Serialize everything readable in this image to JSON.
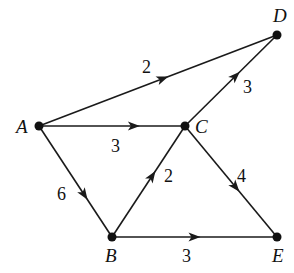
{
  "graph": {
    "type": "directed-weighted-graph",
    "nodes": [
      {
        "id": "A",
        "label": "A",
        "x": 39,
        "y": 126,
        "lx": 16,
        "ly": 133
      },
      {
        "id": "B",
        "label": "B",
        "x": 112,
        "y": 237,
        "lx": 105,
        "ly": 262
      },
      {
        "id": "C",
        "label": "C",
        "x": 185,
        "y": 126,
        "lx": 195,
        "ly": 133
      },
      {
        "id": "D",
        "label": "D",
        "x": 277,
        "y": 35,
        "lx": 273,
        "ly": 22
      },
      {
        "id": "E",
        "label": "E",
        "x": 277,
        "y": 237,
        "lx": 272,
        "ly": 262
      }
    ],
    "edges": [
      {
        "from": "A",
        "to": "D",
        "weight": "2",
        "wx": 142,
        "wy": 73,
        "arrow_t": 0.52
      },
      {
        "from": "A",
        "to": "C",
        "weight": "3",
        "wx": 111,
        "wy": 152,
        "arrow_t": 0.65
      },
      {
        "from": "A",
        "to": "B",
        "weight": "6",
        "wx": 57,
        "wy": 200,
        "arrow_t": 0.62
      },
      {
        "from": "B",
        "to": "C",
        "weight": "2",
        "wx": 164,
        "wy": 182,
        "arrow_t": 0.55
      },
      {
        "from": "C",
        "to": "D",
        "weight": "3",
        "wx": 243,
        "wy": 93,
        "arrow_t": 0.55
      },
      {
        "from": "C",
        "to": "E",
        "weight": "4",
        "wx": 237,
        "wy": 182,
        "arrow_t": 0.55
      },
      {
        "from": "B",
        "to": "E",
        "weight": "3",
        "wx": 182,
        "wy": 262,
        "arrow_t": 0.5
      }
    ]
  }
}
